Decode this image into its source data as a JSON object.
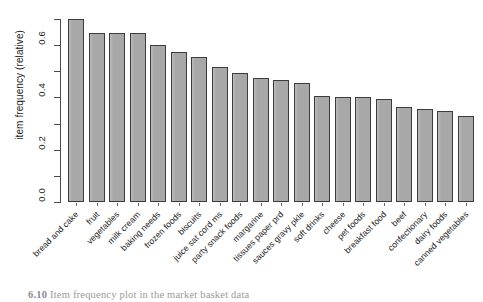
{
  "chart_data": {
    "type": "bar",
    "title": "",
    "xlabel": "",
    "ylabel": "item frequency (relative)",
    "ylim": [
      0.0,
      0.7
    ],
    "grid": false,
    "legend": null,
    "ytick_labels": [
      "0.0",
      "0.2",
      "0.4",
      "0.6"
    ],
    "ytick_values": [
      0.0,
      0.2,
      0.4,
      0.6
    ],
    "yminor_tick_values": [
      0.1,
      0.3,
      0.5,
      0.7
    ],
    "categories": [
      "bread and cake",
      "fruit",
      "vegetables",
      "milk cream",
      "baking needs",
      "frozen foods",
      "biscuits",
      "juice sat cord ms",
      "party snack foods",
      "margarine",
      "tissues paper prd",
      "sauces gravy pkle",
      "soft drinks",
      "cheese",
      "pet foods",
      "breakfast food",
      "beef",
      "confectionary",
      "dairy foods",
      "canned vegetables"
    ],
    "values": [
      0.7,
      0.645,
      0.645,
      0.645,
      0.6,
      0.575,
      0.555,
      0.515,
      0.495,
      0.475,
      0.465,
      0.455,
      0.405,
      0.4,
      0.4,
      0.395,
      0.365,
      0.355,
      0.35,
      0.33
    ]
  },
  "caption": {
    "number": "6.10",
    "text": "Item frequency plot in the market basket data"
  }
}
